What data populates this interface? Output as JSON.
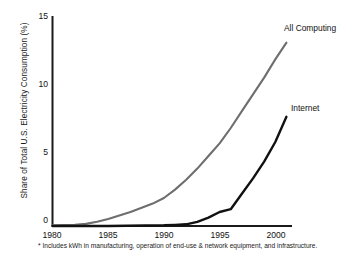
{
  "chart_data": {
    "type": "line",
    "title": "",
    "xlabel": "",
    "ylabel": "Share of Total U.S. Electricity Consumption (%)",
    "xlim": [
      1980,
      2001.5
    ],
    "ylim": [
      0,
      15
    ],
    "xticks": [
      "1980",
      "1985",
      "1990",
      "1995",
      "2000"
    ],
    "xtick_values": [
      1980,
      1985,
      1990,
      1995,
      2000
    ],
    "yticks": [
      "0",
      "5",
      "10",
      "15"
    ],
    "ytick_values": [
      0,
      5,
      10,
      15
    ],
    "grid": false,
    "legend_position": "inline-right-of-line-end",
    "series": [
      {
        "name": "All Computing",
        "color": "#6e6e6e",
        "label": "All Computing",
        "x": [
          1980,
          1982,
          1983,
          1984,
          1985,
          1986,
          1987,
          1988,
          1989,
          1990,
          1991,
          1992,
          1993,
          1994,
          1995,
          1996,
          1997,
          1998,
          1999,
          2000,
          2001
        ],
        "values": [
          0.05,
          0.08,
          0.15,
          0.3,
          0.5,
          0.75,
          1.0,
          1.3,
          1.6,
          2.0,
          2.6,
          3.3,
          4.1,
          5.0,
          5.9,
          7.0,
          8.2,
          9.4,
          10.6,
          11.9,
          13.1
        ]
      },
      {
        "name": "Internet",
        "color": "#111111",
        "label": "Internet",
        "x": [
          1980,
          1985,
          1990,
          1991,
          1992,
          1993,
          1994,
          1995,
          1996,
          1997,
          1998,
          1999,
          2000,
          2001
        ],
        "values": [
          0.0,
          0.0,
          0.05,
          0.08,
          0.12,
          0.3,
          0.6,
          1.0,
          1.2,
          2.3,
          3.4,
          4.6,
          6.0,
          7.8
        ]
      }
    ],
    "annotations": [
      "* Includes kWh in manufacturing, operation of end-use & network equipment, and",
      "infrastructure."
    ]
  },
  "footnote": {
    "line1": "* Includes kWh in manufacturing, operation of end-use & network equipment, and",
    "line2": "infrastructure."
  }
}
